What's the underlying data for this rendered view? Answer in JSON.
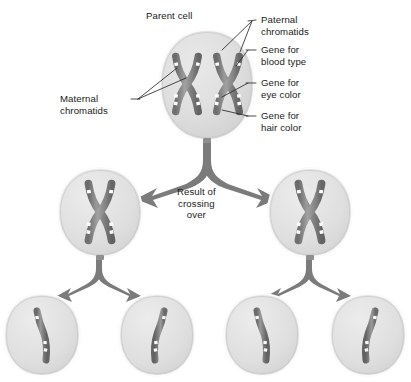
{
  "figure": {
    "background_color": "#ffffff",
    "cell_fill": "#dcdcdc",
    "cell_edge": "#ffffff",
    "chromosome_color": "#8a8a8a",
    "chromosome_dark": "#6f6f6f",
    "gene_band_color": "#ffffff",
    "arrow_color": "#7b7b7b",
    "leader_color": "#2a2a2a",
    "text_color": "#1a1a1a"
  },
  "labels": {
    "parent_cell": "Parent cell",
    "maternal_chromatids": "Maternal\nchromatids",
    "paternal_chromatids": "Paternal\nchromatids",
    "gene_blood_type": "Gene for\nblood type",
    "gene_eye_color": "Gene for\neye color",
    "gene_hair_color": "Gene for\nhair color",
    "result_of_crossing_over": "Result of\ncrossing\nover"
  },
  "diagram": {
    "type": "biology-process-diagram",
    "rows": [
      {
        "row_name": "parent-row",
        "cells": [
          {
            "name": "parent-cell",
            "cx": 207,
            "cy": 85,
            "rx": 47,
            "ry": 55,
            "chromosomes": 2,
            "chromosome_shape": "X",
            "description": "Parent cell containing two homologous chromosome pairs, each an X-shaped pair of sister chromatids with white gene bands"
          }
        ]
      },
      {
        "row_name": "crossing-over-row",
        "cells": [
          {
            "name": "daughter-cell-left",
            "cx": 100,
            "cy": 212,
            "rx": 42,
            "ry": 45,
            "chromosomes": 1,
            "chromosome_shape": "X",
            "description": "Cell after crossing over with one X-shaped recombinant chromosome"
          },
          {
            "name": "daughter-cell-right",
            "cx": 310,
            "cy": 212,
            "rx": 42,
            "ry": 45,
            "chromosomes": 1,
            "chromosome_shape": "X",
            "description": "Cell after crossing over with one X-shaped recombinant chromosome"
          }
        ]
      },
      {
        "row_name": "gamete-row",
        "cells": [
          {
            "name": "gamete-cell-1",
            "cx": 42,
            "cy": 335,
            "rx": 40,
            "ry": 42,
            "chromosomes": 1,
            "chromosome_shape": "single-chromatid",
            "description": "Gamete with a single bent chromatid"
          },
          {
            "name": "gamete-cell-2",
            "cx": 157,
            "cy": 335,
            "rx": 40,
            "ry": 42,
            "chromosomes": 1,
            "chromosome_shape": "single-chromatid",
            "description": "Gamete with a single bent chromatid"
          },
          {
            "name": "gamete-cell-3",
            "cx": 262,
            "cy": 335,
            "rx": 40,
            "ry": 42,
            "chromosomes": 1,
            "chromosome_shape": "single-chromatid",
            "description": "Gamete with a single bent chromatid"
          },
          {
            "name": "gamete-cell-4",
            "cx": 368,
            "cy": 335,
            "rx": 40,
            "ry": 42,
            "chromosomes": 1,
            "chromosome_shape": "single-chromatid",
            "description": "Gamete with a single bent chromatid"
          }
        ]
      }
    ],
    "arrows": [
      {
        "name": "arrow-parent-to-daughters",
        "from": "parent-cell",
        "to": [
          "daughter-cell-left",
          "daughter-cell-right"
        ],
        "style": "forked"
      },
      {
        "name": "arrow-left-daughter-to-gametes",
        "from": "daughter-cell-left",
        "to": [
          "gamete-cell-1",
          "gamete-cell-2"
        ],
        "style": "forked"
      },
      {
        "name": "arrow-right-daughter-to-gametes",
        "from": "daughter-cell-right",
        "to": [
          "gamete-cell-3",
          "gamete-cell-4"
        ],
        "style": "forked"
      }
    ],
    "leader_lines": [
      {
        "name": "leader-paternal-chromatids",
        "label": "paternal_chromatids",
        "targets": 2
      },
      {
        "name": "leader-maternal-chromatids",
        "label": "maternal_chromatids",
        "targets": 2
      },
      {
        "name": "leader-gene-blood-type",
        "label": "gene_blood_type",
        "targets": 1
      },
      {
        "name": "leader-gene-eye-color",
        "label": "gene_eye_color",
        "targets": 1
      },
      {
        "name": "leader-gene-hair-color",
        "label": "gene_hair_color",
        "targets": 1
      }
    ]
  }
}
